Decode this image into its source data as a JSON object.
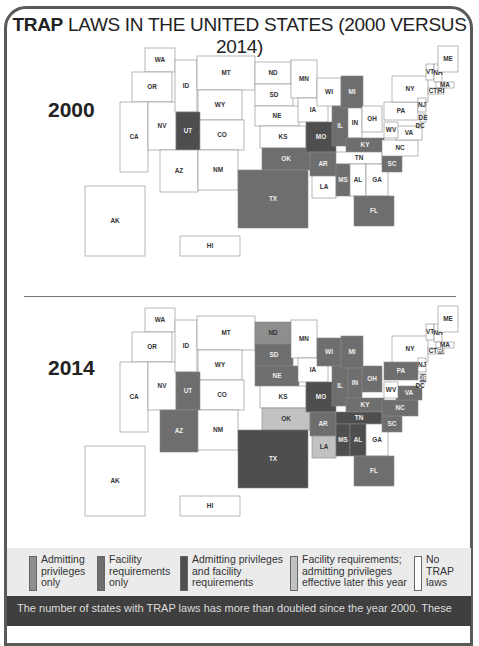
{
  "title": {
    "bold": "TRAP",
    "rest": " LAWS IN THE UNITED STATES (2000 VERSUS 2014)"
  },
  "colors": {
    "admitting_only": "#8e8e8e",
    "facility_only": "#6e6e6e",
    "both": "#4e4e4e",
    "facility_admitting_later": "#c2c2c2",
    "none": "#ffffff"
  },
  "legend": [
    {
      "key": "admitting_only",
      "label": "Admitting privileges only"
    },
    {
      "key": "facility_only",
      "label": "Facility requirements only"
    },
    {
      "key": "both",
      "label": "Admitting privileges and facility requirements"
    },
    {
      "key": "facility_admitting_later",
      "label": "Facility requirements; admitting privileges effective later this year"
    },
    {
      "key": "none",
      "label": "No TRAP laws"
    }
  ],
  "caption": "The number of states with TRAP laws has more than doubled since the year 2000. These",
  "chart_data": [
    {
      "type": "choropleth-map",
      "title": "2000",
      "categories": [
        "admitting_only",
        "facility_only",
        "both",
        "facility_admitting_later",
        "none"
      ],
      "states": {
        "UT": "both",
        "MO": "both",
        "OK": "facility_only",
        "TX": "facility_only",
        "AR": "facility_only",
        "IL": "facility_only",
        "MI": "facility_only",
        "KY": "facility_only",
        "MS": "facility_only",
        "SC": "facility_only",
        "FL": "facility_only"
      },
      "default": "none"
    },
    {
      "type": "choropleth-map",
      "title": "2014",
      "categories": [
        "admitting_only",
        "facility_only",
        "both",
        "facility_admitting_later",
        "none"
      ],
      "states": {
        "ND": "admitting_only",
        "UT": "facility_only",
        "AZ": "facility_only",
        "TX": "both",
        "SD": "facility_only",
        "NE": "facility_only",
        "MO": "both",
        "WI": "facility_only",
        "MI": "facility_only",
        "IL": "facility_only",
        "IN": "facility_only",
        "OH": "facility_only",
        "KY": "facility_only",
        "PA": "facility_only",
        "VA": "facility_only",
        "NC": "facility_only",
        "SC": "facility_only",
        "FL": "facility_only",
        "TN": "both",
        "AR": "facility_only",
        "MS": "both",
        "AL": "both",
        "RI": "facility_only",
        "DE": "facility_only",
        "OK": "facility_admitting_later",
        "LA": "facility_admitting_later"
      },
      "default": "none"
    }
  ],
  "maps": [
    {
      "year_label": "2000"
    },
    {
      "year_label": "2014"
    }
  ]
}
